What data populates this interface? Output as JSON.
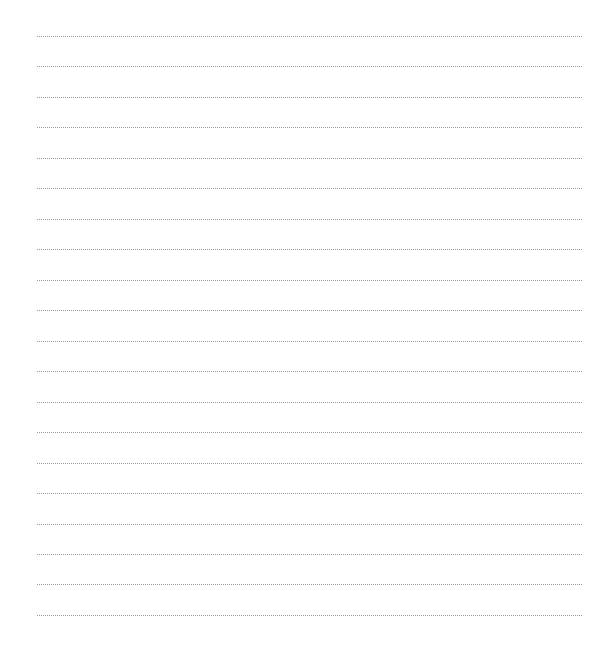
{
  "page": {
    "type": "blank-lined-sheet",
    "line_count": 20,
    "line_style": "dotted",
    "line_color": "#9a9a9a",
    "background_color": "#ffffff"
  }
}
